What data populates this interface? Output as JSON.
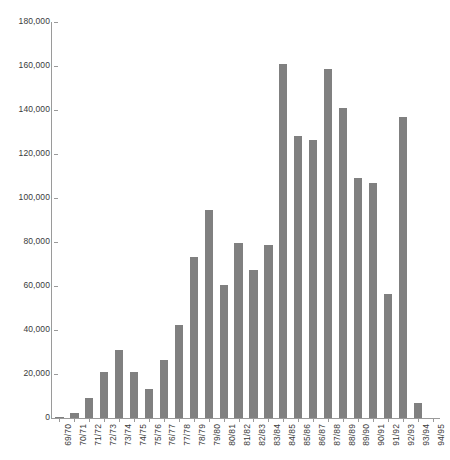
{
  "chart_data": {
    "type": "bar",
    "title": "",
    "subtitle": "",
    "xlabel": "",
    "ylabel": "",
    "ylim": [
      0,
      180000
    ],
    "ytick_values": [
      0,
      20000,
      40000,
      60000,
      80000,
      100000,
      120000,
      140000,
      160000,
      180000
    ],
    "ytick_labels": [
      "0",
      "20,000",
      "40,000",
      "60,000",
      "80,000",
      "100,000",
      "120,000",
      "140,000",
      "160,000",
      "180,000"
    ],
    "grid": false,
    "legend": null,
    "bar_color": "#808080",
    "axis_color": "#9a9a9a",
    "text_color": "#3a3a3a",
    "categories": [
      "69/70",
      "70/71",
      "71/72",
      "72/73",
      "73/74",
      "74/75",
      "75/76",
      "76/77",
      "77/78",
      "78/79",
      "79/80",
      "80/81",
      "81/82",
      "82/83",
      "83/84",
      "84/85",
      "85/86",
      "86/87",
      "87/88",
      "88/89",
      "89/90",
      "90/91",
      "91/92",
      "92/93",
      "93/94",
      "94/95"
    ],
    "values": [
      500,
      2500,
      9000,
      21000,
      31000,
      21000,
      13000,
      26500,
      42500,
      73000,
      94500,
      60500,
      79500,
      67500,
      78500,
      161000,
      128000,
      126500,
      158500,
      141000,
      109000,
      107000,
      56500,
      137000,
      7000,
      0
    ]
  }
}
